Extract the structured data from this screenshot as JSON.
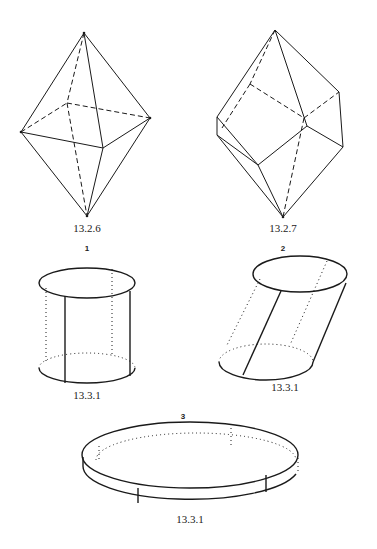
{
  "figures": [
    {
      "id": "octahedron",
      "caption": "13.2.6"
    },
    {
      "id": "truncated-polyhedron",
      "caption": "13.2.7"
    },
    {
      "id": "right-cylinder",
      "number": "1",
      "caption": "13.3.1"
    },
    {
      "id": "oblique-cylinder",
      "number": "2",
      "caption": "13.3.1"
    },
    {
      "id": "flat-disk-cylinder",
      "number": "3",
      "caption": "13.3.1"
    }
  ],
  "colors": {
    "line": "#1a1a1a",
    "background": "#ffffff",
    "text": "#222222"
  }
}
